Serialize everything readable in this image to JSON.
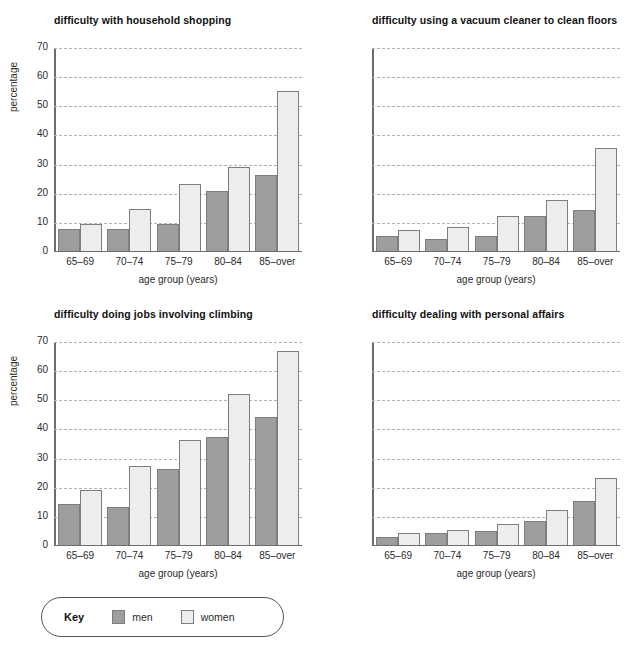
{
  "chart_data": [
    {
      "type": "bar",
      "title": "difficulty with household shopping",
      "xlabel": "age group (years)",
      "ylabel": "percentage",
      "categories": [
        "65–69",
        "70–74",
        "75–79",
        "80–84",
        "85–over"
      ],
      "series": [
        {
          "name": "men",
          "values": [
            7.5,
            7.5,
            9,
            20.5,
            26
          ]
        },
        {
          "name": "women",
          "values": [
            9,
            14.5,
            23,
            29,
            55
          ]
        }
      ],
      "ylim": [
        0,
        70
      ],
      "yticks": [
        0,
        10,
        20,
        30,
        40,
        50,
        60,
        70
      ],
      "grid": true,
      "show_y_axis_labels": true,
      "legend_position": "bottom"
    },
    {
      "type": "bar",
      "title": "difficulty using a vacuum cleaner to clean floors",
      "xlabel": "age group (years)",
      "ylabel": "percentage",
      "categories": [
        "65–69",
        "70–74",
        "75–79",
        "80–84",
        "85–over"
      ],
      "series": [
        {
          "name": "men",
          "values": [
            5,
            4,
            5,
            12,
            14
          ]
        },
        {
          "name": "women",
          "values": [
            7,
            8,
            12,
            17.5,
            35.5
          ]
        }
      ],
      "ylim": [
        0,
        70
      ],
      "yticks": [
        0,
        10,
        20,
        30,
        40,
        50,
        60,
        70
      ],
      "grid": true,
      "show_y_axis_labels": false,
      "legend_position": "bottom"
    },
    {
      "type": "bar",
      "title": "difficulty doing jobs involving climbing",
      "xlabel": "age group (years)",
      "ylabel": "percentage",
      "categories": [
        "65–69",
        "70–74",
        "75–79",
        "80–84",
        "85–over"
      ],
      "series": [
        {
          "name": "men",
          "values": [
            14,
            13,
            26,
            37,
            44
          ]
        },
        {
          "name": "women",
          "values": [
            19,
            27,
            36,
            52,
            67
          ]
        }
      ],
      "ylim": [
        0,
        70
      ],
      "yticks": [
        0,
        10,
        20,
        30,
        40,
        50,
        60,
        70
      ],
      "grid": true,
      "show_y_axis_labels": true,
      "legend_position": "bottom"
    },
    {
      "type": "bar",
      "title": "difficulty dealing with personal affairs",
      "xlabel": "age group (years)",
      "ylabel": "percentage",
      "categories": [
        "65–69",
        "70–74",
        "75–79",
        "80–84",
        "85–over"
      ],
      "series": [
        {
          "name": "men",
          "values": [
            2.5,
            4,
            4.5,
            8,
            15
          ]
        },
        {
          "name": "women",
          "values": [
            4,
            5,
            7,
            12,
            23
          ]
        }
      ],
      "ylim": [
        0,
        70
      ],
      "yticks": [
        0,
        10,
        20,
        30,
        40,
        50,
        60,
        70
      ],
      "grid": true,
      "show_y_axis_labels": false,
      "legend_position": "bottom"
    }
  ],
  "key": {
    "title": "Key",
    "items": [
      {
        "label": "men",
        "color": "#9d9d9d"
      },
      {
        "label": "women",
        "color": "#ededed"
      }
    ]
  },
  "colors": {
    "men": "#9d9d9d",
    "women": "#ededed",
    "bar_border": "#7d7d7d",
    "axis": "#6e6e6e",
    "gridline": "#a9b4bd",
    "text": "#2b2b2b"
  }
}
